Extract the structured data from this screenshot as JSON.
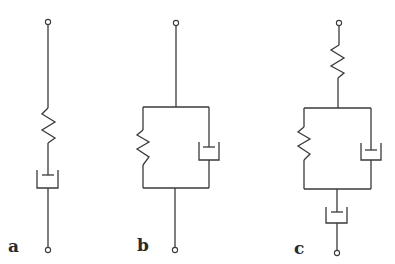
{
  "figure": {
    "panels": [
      {
        "label": "a",
        "model": "spring and dashpot in series"
      },
      {
        "label": "b",
        "model": "spring and dashpot in parallel"
      },
      {
        "label": "c",
        "model": "spring in series with parallel spring-dashpot, in series with dashpot"
      }
    ]
  },
  "colors": {
    "line": "#3a3a3a",
    "background": "#ffffff",
    "label": "#2a2a2a"
  }
}
